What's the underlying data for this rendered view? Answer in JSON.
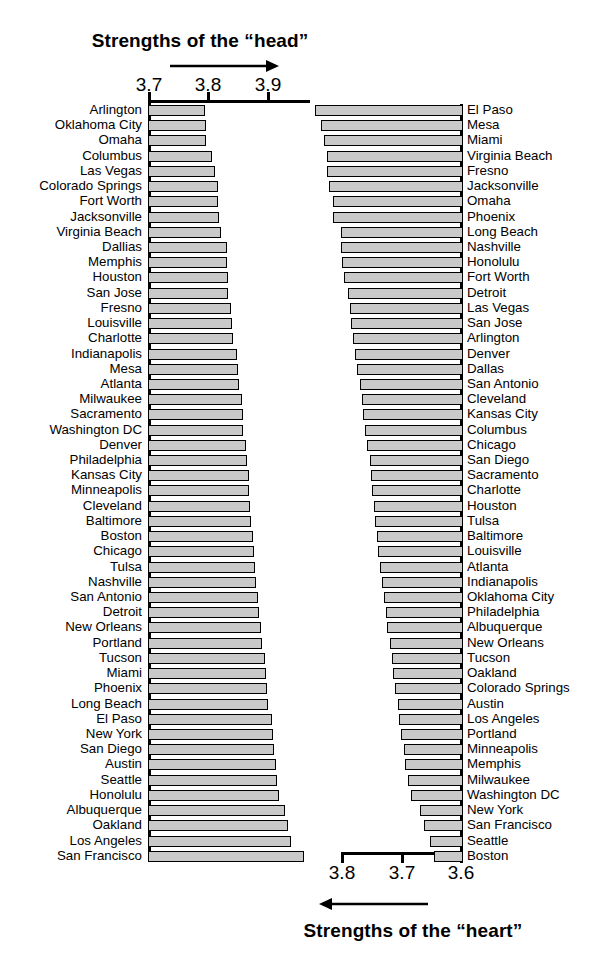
{
  "titles": {
    "head": "Strengths of the “head”",
    "heart": "Strengths of the “heart”"
  },
  "axes": {
    "top_ticks": [
      "3.7",
      "3.8",
      "3.9"
    ],
    "bottom_ticks": [
      "3.8",
      "3.7",
      "3.6"
    ]
  },
  "colors": {
    "bar_fill": "#c9c9c9",
    "bar_stroke": "#000000",
    "background": "#ffffff",
    "text": "#000000"
  },
  "chart_data": {
    "type": "bar",
    "orientation": "horizontal",
    "panels": [
      {
        "name": "head",
        "title": "Strengths of the “head”",
        "label_side": "left",
        "direction": "increasing-rightward",
        "xlim": [
          3.7,
          3.97
        ],
        "xlabel": "",
        "ylabel": "",
        "ticks": [
          3.7,
          3.8,
          3.9
        ],
        "grid": false,
        "categories": [
          "Arlington",
          "Oklahoma City",
          "Omaha",
          "Columbus",
          "Las Vegas",
          "Colorado Springs",
          "Fort Worth",
          "Jacksonville",
          "Virginia Beach",
          "Dallias",
          "Memphis",
          "Houston",
          "San Jose",
          "Fresno",
          "Louisville",
          "Charlotte",
          "Indianapolis",
          "Mesa",
          "Atlanta",
          "Milwaukee",
          "Sacramento",
          "Washington DC",
          "Denver",
          "Philadelphia",
          "Kansas City",
          "Minneapolis",
          "Cleveland",
          "Baltimore",
          "Boston",
          "Chicago",
          "Tulsa",
          "Nashville",
          "San Antonio",
          "Detroit",
          "New Orleans",
          "Portland",
          "Tucson",
          "Miami",
          "Phoenix",
          "Long Beach",
          "El Paso",
          "New York",
          "San Diego",
          "Austin",
          "Seattle",
          "Honolulu",
          "Albuquerque",
          "Oakland",
          "Los Angeles",
          "San Francisco"
        ],
        "values": [
          3.795,
          3.798,
          3.798,
          3.808,
          3.813,
          3.818,
          3.818,
          3.82,
          3.822,
          3.832,
          3.833,
          3.835,
          3.835,
          3.84,
          3.842,
          3.843,
          3.85,
          3.852,
          3.853,
          3.858,
          3.86,
          3.86,
          3.865,
          3.867,
          3.87,
          3.87,
          3.872,
          3.873,
          3.877,
          3.878,
          3.88,
          3.882,
          3.885,
          3.887,
          3.89,
          3.892,
          3.897,
          3.898,
          3.9,
          3.902,
          3.908,
          3.91,
          3.912,
          3.915,
          3.917,
          3.92,
          3.93,
          3.935,
          3.94,
          3.962
        ]
      },
      {
        "name": "heart",
        "title": "Strengths of the “heart”",
        "label_side": "right",
        "direction": "increasing-leftward",
        "xlim": [
          3.6,
          3.85
        ],
        "xlabel": "",
        "ylabel": "",
        "ticks": [
          3.8,
          3.7,
          3.6
        ],
        "grid": false,
        "categories": [
          "El Paso",
          "Mesa",
          "Miami",
          "Virginia Beach",
          "Fresno",
          "Jacksonville",
          "Omaha",
          "Phoenix",
          "Long Beach",
          "Nashville",
          "Honolulu",
          "Fort Worth",
          "Detroit",
          "Las Vegas",
          "San Jose",
          "Arlington",
          "Denver",
          "Dallas",
          "San Antonio",
          "Cleveland",
          "Kansas City",
          "Columbus",
          "Chicago",
          "San Diego",
          "Sacramento",
          "Charlotte",
          "Houston",
          "Tulsa",
          "Baltimore",
          "Louisville",
          "Atlanta",
          "Indianapolis",
          "Oklahoma City",
          "Philadelphia",
          "Albuquerque",
          "New Orleans",
          "Tucson",
          "Oakland",
          "Colorado Springs",
          "Austin",
          "Los Angeles",
          "Portland",
          "Minneapolis",
          "Memphis",
          "Milwaukee",
          "Washington DC",
          "New York",
          "San Francisco",
          "Seattle",
          "Boston"
        ],
        "values": [
          3.848,
          3.838,
          3.833,
          3.828,
          3.828,
          3.825,
          3.818,
          3.818,
          3.805,
          3.805,
          3.803,
          3.8,
          3.793,
          3.79,
          3.788,
          3.785,
          3.782,
          3.778,
          3.773,
          3.77,
          3.768,
          3.765,
          3.762,
          3.757,
          3.755,
          3.753,
          3.75,
          3.748,
          3.745,
          3.743,
          3.74,
          3.737,
          3.733,
          3.73,
          3.727,
          3.723,
          3.72,
          3.718,
          3.715,
          3.71,
          3.707,
          3.705,
          3.7,
          3.697,
          3.693,
          3.688,
          3.672,
          3.665,
          3.655,
          3.648
        ]
      }
    ]
  }
}
